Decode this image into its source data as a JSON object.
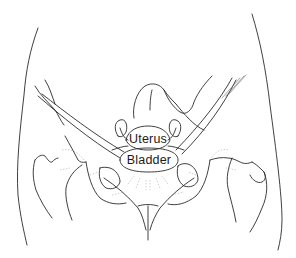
{
  "figure": {
    "type": "anatomical-line-drawing",
    "labels": {
      "uterus": "Uterus",
      "bladder": "Bladder"
    },
    "colors": {
      "line": "#2a2a2a",
      "background": "#ffffff"
    }
  }
}
